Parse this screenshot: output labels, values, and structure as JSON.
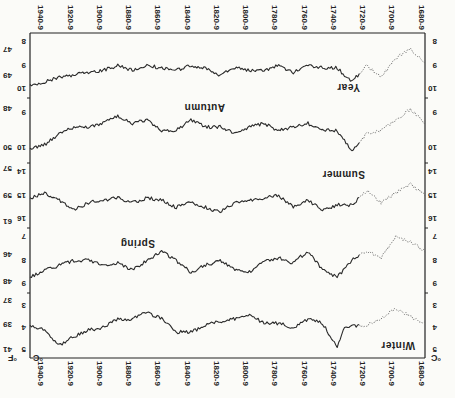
{
  "chart_data": {
    "type": "line",
    "orientation_note": "figure appears rotated 180 degrees in screenshot",
    "title": "",
    "xlabel": "",
    "left_axis_unit": "°C",
    "right_axis_unit": "°F",
    "x_tick_labels": [
      "1680-9",
      "1700-9",
      "1720-9",
      "1740-9",
      "1760-9",
      "1780-9",
      "1800-9",
      "1820-9",
      "1840-9",
      "1860-9",
      "1880-9",
      "1900-9",
      "1920-9",
      "1940-9"
    ],
    "x_range": [
      1680,
      1950
    ],
    "uncertain_before": 1725,
    "panels": [
      {
        "name": "Winter",
        "celsius_ticks": [
          "3",
          "4",
          "5"
        ],
        "fahrenheit_ticks": [
          "37",
          "39",
          "41"
        ],
        "ylim_c": [
          2.6,
          5.2
        ],
        "x": [
          1680,
          1690,
          1700,
          1710,
          1720,
          1730,
          1735,
          1740,
          1750,
          1760,
          1770,
          1780,
          1790,
          1800,
          1810,
          1820,
          1830,
          1840,
          1850,
          1860,
          1870,
          1880,
          1890,
          1900,
          1910,
          1920,
          1930,
          1940,
          1950
        ],
        "values": [
          3.8,
          3.5,
          3.1,
          3.6,
          3.9,
          3.9,
          4.0,
          4.9,
          3.8,
          3.6,
          4.0,
          3.8,
          3.8,
          3.4,
          3.6,
          3.7,
          3.9,
          4.2,
          4.2,
          3.6,
          3.3,
          3.6,
          3.6,
          4.0,
          4.1,
          4.4,
          4.8,
          4.1,
          3.9
        ]
      },
      {
        "name": "Spring",
        "celsius_ticks": [
          "7",
          "8",
          "9"
        ],
        "fahrenheit_ticks": [
          "46",
          "48"
        ],
        "ylim_c": [
          6.8,
          9.2
        ],
        "x": [
          1680,
          1690,
          1700,
          1710,
          1720,
          1730,
          1740,
          1750,
          1760,
          1770,
          1780,
          1790,
          1800,
          1810,
          1820,
          1830,
          1840,
          1850,
          1860,
          1870,
          1880,
          1890,
          1900,
          1910,
          1920,
          1930,
          1940,
          1950
        ],
        "values": [
          7.6,
          7.2,
          7.0,
          7.9,
          7.6,
          8.0,
          8.7,
          8.4,
          7.6,
          8.1,
          7.9,
          8.0,
          8.5,
          8.4,
          8.0,
          8.2,
          8.5,
          8.0,
          7.6,
          8.0,
          8.4,
          8.1,
          8.2,
          8.0,
          8.0,
          8.2,
          8.4,
          8.7
        ]
      },
      {
        "name": "Summer",
        "celsius_ticks": [
          "14",
          "15",
          "16"
        ],
        "fahrenheit_ticks": [
          "57",
          "59",
          "61"
        ],
        "ylim_c": [
          13.8,
          16.2
        ],
        "x": [
          1680,
          1690,
          1700,
          1710,
          1720,
          1730,
          1740,
          1750,
          1760,
          1770,
          1780,
          1790,
          1800,
          1810,
          1820,
          1830,
          1840,
          1850,
          1860,
          1870,
          1880,
          1890,
          1900,
          1910,
          1920,
          1930,
          1940,
          1950
        ],
        "values": [
          15.0,
          14.5,
          14.9,
          15.3,
          14.8,
          15.4,
          15.4,
          15.6,
          15.2,
          15.5,
          15.0,
          15.1,
          15.2,
          15.3,
          15.7,
          15.5,
          15.3,
          15.5,
          15.2,
          15.1,
          15.3,
          15.1,
          15.2,
          15.3,
          15.6,
          15.2,
          14.9,
          15.1
        ]
      },
      {
        "name": "Autumn",
        "celsius_ticks": [
          "9",
          "10"
        ],
        "fahrenheit_ticks": [
          "48",
          "50"
        ],
        "ylim_c": [
          8.7,
          10.3
        ],
        "x": [
          1680,
          1690,
          1700,
          1710,
          1720,
          1730,
          1740,
          1750,
          1760,
          1770,
          1780,
          1790,
          1800,
          1810,
          1820,
          1830,
          1840,
          1850,
          1860,
          1870,
          1880,
          1890,
          1900,
          1910,
          1920,
          1930,
          1940,
          1950
        ],
        "values": [
          9.3,
          8.9,
          9.2,
          9.5,
          9.6,
          10.1,
          9.5,
          9.5,
          9.3,
          9.4,
          9.5,
          9.3,
          9.4,
          9.6,
          9.4,
          9.4,
          9.2,
          9.5,
          9.5,
          9.2,
          9.3,
          9.1,
          9.3,
          9.4,
          9.4,
          9.6,
          9.9,
          10.0
        ]
      },
      {
        "name": "Year",
        "celsius_ticks": [
          "8",
          "9",
          "10"
        ],
        "fahrenheit_ticks": [
          "47",
          "49"
        ],
        "ylim_c": [
          7.8,
          10.2
        ],
        "x": [
          1680,
          1690,
          1700,
          1710,
          1720,
          1730,
          1740,
          1750,
          1760,
          1770,
          1780,
          1790,
          1800,
          1810,
          1820,
          1830,
          1840,
          1850,
          1860,
          1870,
          1880,
          1890,
          1900,
          1910,
          1920,
          1930,
          1940,
          1950
        ],
        "values": [
          8.9,
          8.3,
          8.7,
          9.5,
          9.0,
          9.7,
          9.1,
          9.1,
          9.0,
          9.3,
          9.0,
          9.2,
          9.2,
          9.1,
          9.4,
          9.1,
          9.0,
          9.2,
          9.1,
          9.0,
          9.2,
          9.0,
          9.2,
          9.3,
          9.4,
          9.5,
          9.7,
          9.8
        ]
      }
    ]
  },
  "labels": {
    "unit_c": "°C",
    "unit_f": "°F",
    "winter": "Winter",
    "spring": "Spring",
    "summer": "Summer",
    "autumn": "Autumn",
    "year": "Year"
  }
}
